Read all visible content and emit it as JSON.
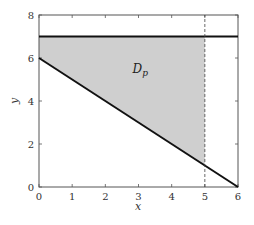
{
  "chart_data": {
    "type": "area",
    "title": "",
    "xlabel": "x",
    "ylabel": "y",
    "xlim": [
      0,
      6
    ],
    "ylim": [
      0,
      8
    ],
    "xticks": [
      0,
      1,
      2,
      3,
      4,
      5,
      6
    ],
    "yticks": [
      0,
      2,
      4,
      6,
      8
    ],
    "grid": false,
    "series": [
      {
        "name": "upper-bound",
        "style": "solid-thick",
        "x": [
          0,
          6
        ],
        "y": [
          7,
          7
        ]
      },
      {
        "name": "lower-bound",
        "style": "solid-thick",
        "x": [
          0,
          6
        ],
        "y": [
          6,
          0
        ]
      },
      {
        "name": "x-equals-5",
        "style": "dashed",
        "x": [
          5,
          5
        ],
        "y": [
          0,
          8
        ]
      }
    ],
    "region": {
      "name": "D_p",
      "label": "D",
      "label_sub": "p",
      "label_pos": [
        3,
        5.5
      ],
      "polygon": [
        [
          0,
          7
        ],
        [
          5,
          7
        ],
        [
          5,
          1
        ],
        [
          0,
          6
        ]
      ],
      "fill": "#cfcfcf"
    }
  },
  "colors": {
    "line": "#111111",
    "frame": "#555555",
    "region": "#cfcfcf"
  }
}
